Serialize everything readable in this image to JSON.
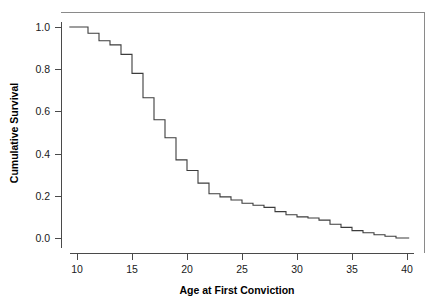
{
  "chart_data": {
    "type": "line",
    "subtype": "step-survival-curve",
    "title": "",
    "xlabel": "Age at First Conviction",
    "ylabel": "Cumulative Survival",
    "xlim": [
      8.5,
      41.5
    ],
    "ylim": [
      -0.05,
      1.07
    ],
    "xticks": [
      10,
      15,
      20,
      25,
      30,
      35,
      40
    ],
    "xtick_labels": [
      "10",
      "15",
      "20",
      "25",
      "30",
      "35",
      "40"
    ],
    "yticks": [
      0.0,
      0.2,
      0.4,
      0.6,
      0.8,
      1.0
    ],
    "ytick_labels": [
      "0.0",
      "0.2",
      "0.4",
      "0.6",
      "0.8",
      "1.0"
    ],
    "grid": false,
    "legend": null,
    "series": [
      {
        "name": "Cumulative Survival",
        "step": "post",
        "color": "#3c3c3c",
        "x": [
          9.3,
          11,
          12,
          13,
          14,
          15,
          16,
          17,
          18,
          19,
          20,
          21,
          22,
          23,
          24,
          25,
          26,
          27,
          28,
          29,
          30,
          31,
          32,
          33,
          34,
          35,
          36,
          37,
          38,
          39,
          40.2
        ],
        "y": [
          1.0,
          0.97,
          0.935,
          0.915,
          0.87,
          0.78,
          0.665,
          0.56,
          0.475,
          0.37,
          0.32,
          0.26,
          0.21,
          0.195,
          0.18,
          0.165,
          0.155,
          0.145,
          0.125,
          0.11,
          0.1,
          0.095,
          0.085,
          0.065,
          0.05,
          0.035,
          0.025,
          0.015,
          0.008,
          0.0,
          0.0
        ]
      }
    ]
  },
  "axes": {
    "x_title": "Age at First Conviction",
    "y_title": "Cumulative Survival"
  },
  "ticks": {
    "x": [
      "10",
      "15",
      "20",
      "25",
      "30",
      "35",
      "40"
    ],
    "y": [
      "0.0",
      "0.2",
      "0.4",
      "0.6",
      "0.8",
      "1.0"
    ]
  },
  "colors": {
    "curve": "#3c3c3c",
    "axis": "#4a4a4a",
    "border": "#8a8a8a",
    "background": "#ffffff",
    "text": "#1a1a1a"
  }
}
